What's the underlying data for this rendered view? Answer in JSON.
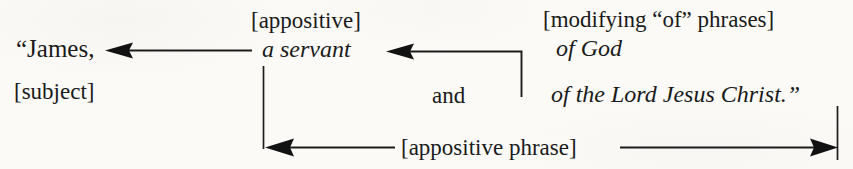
{
  "diagram": {
    "source_text": "“James, a servant of God and of the Lord Jesus Christ.”",
    "ink_color": "#1c1c1c",
    "background_color": "#fbfaf7",
    "labels": {
      "subject_word": "“James,",
      "subject_tag": "[subject]",
      "appositive_tag": "[appositive]",
      "appositive_word": "a servant",
      "modifying_tag": "[modifying “of” phrases]",
      "of_god": "of God",
      "conjunction": "and",
      "of_lord": "of the Lord Jesus Christ.”",
      "appositive_phrase_tag": "[appositive phrase]"
    },
    "connectors": [
      {
        "name": "servant-to-james",
        "from": "a servant",
        "to": "“James,",
        "direction": "left",
        "arrowheads": 1
      },
      {
        "name": "of-phrases-to-servant",
        "from": "of phrases group",
        "to": "a servant",
        "direction": "left-elbow",
        "arrowheads": 1
      },
      {
        "name": "appositive-phrase-span",
        "from": "a servant",
        "to": "of the Lord Jesus Christ.”",
        "direction": "double",
        "arrowheads": 2
      }
    ]
  }
}
